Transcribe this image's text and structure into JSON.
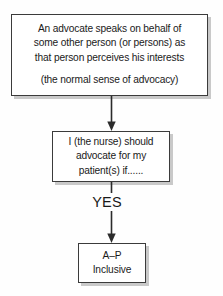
{
  "diagram": {
    "type": "flowchart",
    "orientation": "top-to-bottom",
    "background_color": "#fefefe",
    "box_border_color": "#3b3b3b",
    "box_fill_color": "#ffffff",
    "shadow_color": "#c9c9c9",
    "text_color": "#1a1a1a",
    "nodes": [
      {
        "id": "definition",
        "shape": "rectangle",
        "lines": [
          "An advocate speaks on behalf of",
          "some other person (or persons) as",
          "that person perceives his interests",
          "",
          "(the normal sense of advocacy)"
        ]
      },
      {
        "id": "condition",
        "shape": "rectangle",
        "lines": [
          "I (the nurse) should",
          "advocate for my",
          "patient(s) if......"
        ]
      },
      {
        "id": "outcome",
        "shape": "rectangle",
        "lines": [
          "A–P",
          "Inclusive"
        ]
      }
    ],
    "edges": [
      {
        "id": "definition-to-condition",
        "from": "definition",
        "to": "condition",
        "label": "",
        "arrowhead": "filled-triangle"
      },
      {
        "id": "condition-to-outcome",
        "from": "condition",
        "to": "outcome",
        "label": "YES",
        "arrowhead": "filled-triangle"
      }
    ]
  }
}
